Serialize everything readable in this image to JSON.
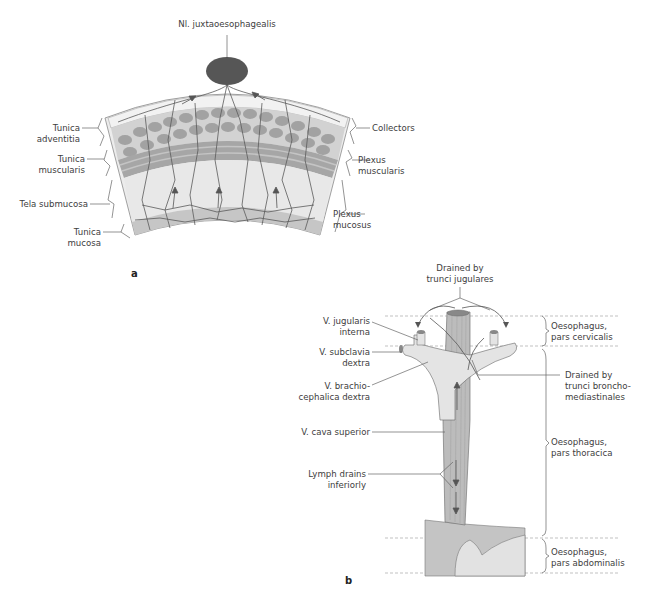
{
  "figure": {
    "panel_a": {
      "panel_label": "a",
      "top_label": "Nl. juxtaoesophagealis",
      "left_labels": [
        {
          "line1": "Tunica",
          "line2": "adventitia"
        },
        {
          "line1": "Tunica",
          "line2": "muscularis"
        },
        {
          "line1": "Tela submucosa",
          "line2": ""
        },
        {
          "line1": "Tunica",
          "line2": "mucosa"
        }
      ],
      "right_labels": [
        {
          "line1": "Collectors",
          "line2": ""
        },
        {
          "line1": "Plexus",
          "line2": "muscularis"
        },
        {
          "line1": "Plexus",
          "line2": "mucosus"
        }
      ]
    },
    "panel_b": {
      "panel_label": "b",
      "top_label": {
        "line1": "Drained by",
        "line2": "trunci jugulares"
      },
      "left_labels": [
        {
          "line1": "V. jugularis",
          "line2": "interna"
        },
        {
          "line1": "V. subclavia",
          "line2": "dextra"
        },
        {
          "line1": "V. brachio-",
          "line2": "cephalica dextra"
        },
        {
          "line1": "V. cava superior",
          "line2": ""
        },
        {
          "line1": "Lymph drains",
          "line2": "inferiorly"
        }
      ],
      "right_labels": [
        {
          "line1": "Oesophagus,",
          "line2": "pars cervicalis"
        },
        {
          "line1": "Drained by",
          "line2": "trunci broncho-",
          "line3": "mediastinales"
        },
        {
          "line1": "Oesophagus,",
          "line2": "pars thoracica"
        },
        {
          "line1": "Oesophagus,",
          "line2": "pars abdominalis"
        }
      ]
    },
    "colors": {
      "node": "#555555",
      "adventitia": "#e6e6e6",
      "muscle_dark": "#9a9a9a",
      "muscle_light": "#bdbdbd",
      "submucosa": "#e9e9e9",
      "mucosa": "#c8c8c8",
      "vessel": "#5a5a5a",
      "vein_fill": "#e4e4e4",
      "esophagus_fill": "#b8b8b8",
      "stomach_fill": "#bfbfbf"
    }
  }
}
